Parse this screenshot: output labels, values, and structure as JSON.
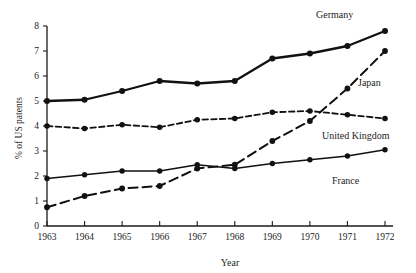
{
  "chart_data": {
    "type": "line",
    "title": "",
    "xlabel": "Year",
    "ylabel": "% of US patents",
    "x": [
      1963,
      1964,
      1965,
      1966,
      1967,
      1968,
      1969,
      1970,
      1971,
      1972
    ],
    "xtick_labels": [
      "1963",
      "1964",
      "1965",
      "1966",
      "1967",
      "1968",
      "1969",
      "1970",
      "1971",
      "1972"
    ],
    "ytick_labels": [
      "0",
      "1",
      "2",
      "3",
      "4",
      "5",
      "6",
      "7",
      "8"
    ],
    "xlim": [
      1963,
      1972
    ],
    "ylim": [
      0,
      8
    ],
    "grid": false,
    "legend_position": "inline-right-of-series-end",
    "series": [
      {
        "name": "Germany",
        "style": "solid-thick",
        "color": "#111111",
        "values": [
          5.0,
          5.05,
          5.4,
          5.8,
          5.7,
          5.8,
          6.7,
          6.9,
          7.2,
          7.8
        ],
        "label": "Germany"
      },
      {
        "name": "Japan",
        "style": "long-dash",
        "color": "#111111",
        "values": [
          0.75,
          1.2,
          1.5,
          1.6,
          2.3,
          2.45,
          3.4,
          4.2,
          5.5,
          7.0
        ],
        "label": "Japan"
      },
      {
        "name": "United Kingdom",
        "style": "short-dash",
        "color": "#111111",
        "values": [
          4.0,
          3.9,
          4.05,
          3.95,
          4.25,
          4.3,
          4.55,
          4.6,
          4.45,
          4.3
        ],
        "label": "United Kingdom"
      },
      {
        "name": "France",
        "style": "solid-thin",
        "color": "#111111",
        "values": [
          1.9,
          2.05,
          2.2,
          2.2,
          2.45,
          2.3,
          2.5,
          2.65,
          2.8,
          3.05
        ],
        "label": "France"
      }
    ],
    "annotations": []
  },
  "labels": {
    "germany": "Germany",
    "japan": "Japan",
    "united_kingdom": "United Kingdom",
    "france": "France",
    "x_axis_title": "Year",
    "y_axis_title": "% of US patents"
  }
}
